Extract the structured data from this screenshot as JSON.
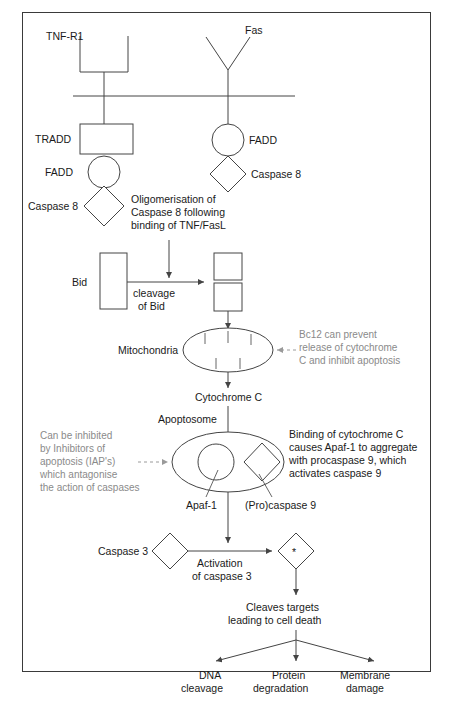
{
  "figure": {
    "domain_title": "Apoptosis signalling pathway diagram",
    "colors": {
      "stroke": "#444444",
      "frame": "#3a3a3a",
      "text": "#1a1a1a",
      "annotation_gray": "#8a8a8a"
    }
  },
  "receptors": {
    "tnf_r1_label": "TNF-R1",
    "fas_label": "Fas"
  },
  "adaptors": {
    "tradd_label": "TRADD",
    "fadd_left_label": "FADD",
    "caspase8_left_label": "Caspase 8",
    "fadd_right_label": "FADD",
    "caspase8_right_label": "Caspase 8"
  },
  "annotations": {
    "oligomerisation": {
      "line1": "Oligomerisation of",
      "line2": "Caspase 8 following",
      "line3": "binding of TNF/FasL"
    },
    "bcl2": {
      "line1": "Bc12 can prevent",
      "line2": "release of cytochrome",
      "line3": "C and inhibit apoptosis"
    },
    "iap": {
      "line1": "Can be inhibited",
      "line2": "by Inhibitors of",
      "line3": "apoptosis (IAP's)",
      "line4": "which antagonise",
      "line5": "the action of caspases"
    },
    "cytochrome_binding": {
      "line1": "Binding of cytochrome C",
      "line2": "causes Apaf-1 to aggregate",
      "line3": "with procaspase 9, which",
      "line4": "activates caspase 9"
    }
  },
  "bid": {
    "label": "Bid",
    "cleavage_line1": "cleavage",
    "cleavage_line2": "of Bid"
  },
  "mitochondria": {
    "label": "Mitochondria",
    "output_label": "Cytochrome C"
  },
  "apoptosome": {
    "label": "Apoptosome",
    "apaf1_label": "Apaf-1",
    "procaspase9_label": "(Pro)caspase 9"
  },
  "caspase3": {
    "label": "Caspase 3",
    "activation_line1": "Activation",
    "activation_line2": "of caspase 3",
    "active_marker": "*"
  },
  "outcome": {
    "cleaves_line1": "Cleaves targets",
    "cleaves_line2": "leading to cell death",
    "branches": [
      {
        "line1": "DNA",
        "line2": "cleavage"
      },
      {
        "line1": "Protein",
        "line2": "degradation"
      },
      {
        "line1": "Membrane",
        "line2": "damage"
      }
    ]
  }
}
